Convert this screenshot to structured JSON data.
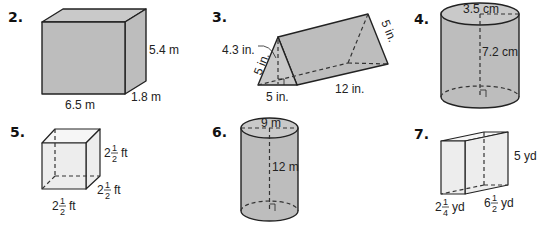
{
  "problems": [
    {
      "number": "2.",
      "shape": "rectangular-prism",
      "labels": {
        "length": "6.5 m",
        "width": "1.8 m",
        "height": "5.4 m"
      }
    },
    {
      "number": "3.",
      "shape": "triangular-prism",
      "labels": {
        "triangle_height": "4.3 in.",
        "side_left": "5 in.",
        "base": "5 in.",
        "length": "12 in.",
        "side_right": "5 in."
      }
    },
    {
      "number": "4.",
      "shape": "cylinder",
      "labels": {
        "diameter": "3.5 cm",
        "height": "7.2 cm"
      }
    },
    {
      "number": "5.",
      "shape": "cube",
      "labels": {
        "height": {
          "whole": "2",
          "num": "1",
          "den": "2",
          "unit": "ft"
        },
        "depth": {
          "whole": "2",
          "num": "1",
          "den": "2",
          "unit": "ft"
        },
        "width": {
          "whole": "2",
          "num": "1",
          "den": "2",
          "unit": "ft"
        }
      }
    },
    {
      "number": "6.",
      "shape": "cylinder",
      "labels": {
        "diameter": "9 m",
        "height": "12 m"
      }
    },
    {
      "number": "7.",
      "shape": "rectangular-prism",
      "labels": {
        "height": "5 yd",
        "width": {
          "whole": "2",
          "num": "1",
          "den": "4",
          "unit": "yd"
        },
        "length": {
          "whole": "6",
          "num": "1",
          "den": "2",
          "unit": "yd"
        }
      }
    }
  ]
}
